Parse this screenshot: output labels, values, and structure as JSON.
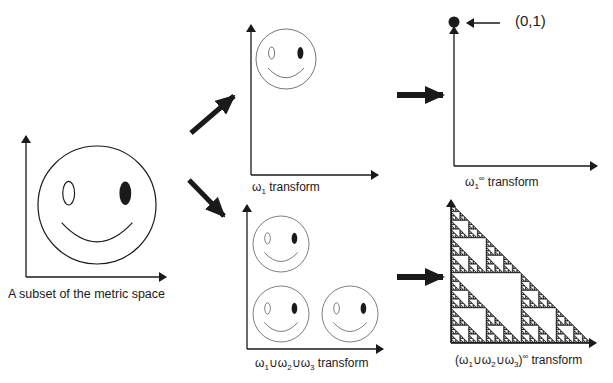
{
  "colors": {
    "ink": "#1a1a1a",
    "background": "#ffffff"
  },
  "panels": {
    "source": {
      "label": "A subset of the metric space"
    },
    "omega1": {
      "label_symbol": "ω",
      "label_sub": "1",
      "label_rest": " transform"
    },
    "omega1_inf": {
      "label_symbol": "ω",
      "label_sub": "1",
      "label_sup": "∞",
      "label_rest": " transform",
      "point_label": "(0,1)"
    },
    "union": {
      "label_html_parts": [
        "ω",
        "1",
        "∪ω",
        "2",
        "∪ω",
        "3",
        " transform"
      ]
    },
    "union_inf": {
      "label_parts": [
        "(ω",
        "1",
        "∪ω",
        "2",
        "∪ω",
        "3",
        ")",
        "∞",
        " transform"
      ]
    }
  },
  "arrows": [
    {
      "name": "to-omega1",
      "direction": "up-right"
    },
    {
      "name": "to-union",
      "direction": "down-right"
    },
    {
      "name": "to-omega1-inf",
      "direction": "right"
    },
    {
      "name": "to-union-inf",
      "direction": "right"
    }
  ]
}
